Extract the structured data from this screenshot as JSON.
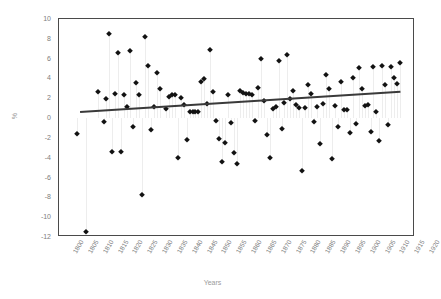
{
  "chart_data": {
    "type": "scatter",
    "title": "",
    "xlabel": "Years",
    "ylabel": "%",
    "xlim": [
      1800,
      1920
    ],
    "ylim": [
      -12,
      10
    ],
    "xtick_step": 5,
    "ytick_step": 2,
    "grid": false,
    "legend": "none",
    "marker": "diamond",
    "marker_color": "#121212",
    "dropline_color": "#ededed",
    "trendline": {
      "type": "linear",
      "color": "#3a3a3a",
      "x_start": 1807,
      "y_start": 0.7,
      "x_end": 1915,
      "y_end": 2.75
    },
    "xtick_labels": [
      "1800",
      "1805",
      "1810",
      "1815",
      "1820",
      "1825",
      "1830",
      "1835",
      "1840",
      "1845",
      "1850",
      "1855",
      "1860",
      "1865",
      "1870",
      "1875",
      "1880",
      "1885",
      "1890",
      "1895",
      "1900",
      "1905",
      "1910",
      "1915",
      "1920"
    ],
    "ytick_labels": [
      "10",
      "8",
      "6",
      "4",
      "2",
      "0",
      "-2",
      "-4",
      "-6",
      "-8",
      "-10",
      "-12"
    ],
    "points": [
      {
        "x": 1806,
        "y": -1.6
      },
      {
        "x": 1809,
        "y": -11.5
      },
      {
        "x": 1813,
        "y": 2.6
      },
      {
        "x": 1815,
        "y": -0.4
      },
      {
        "x": 1816,
        "y": 1.9
      },
      {
        "x": 1817,
        "y": 8.5
      },
      {
        "x": 1818,
        "y": -3.4
      },
      {
        "x": 1819,
        "y": 2.4
      },
      {
        "x": 1820,
        "y": 6.6
      },
      {
        "x": 1821,
        "y": -3.4
      },
      {
        "x": 1822,
        "y": 2.3
      },
      {
        "x": 1823,
        "y": 1.1
      },
      {
        "x": 1824,
        "y": 6.8
      },
      {
        "x": 1825,
        "y": -0.9
      },
      {
        "x": 1826,
        "y": 3.5
      },
      {
        "x": 1827,
        "y": 2.3
      },
      {
        "x": 1828,
        "y": -7.8
      },
      {
        "x": 1829,
        "y": 8.2
      },
      {
        "x": 1830,
        "y": 5.3
      },
      {
        "x": 1831,
        "y": -1.2
      },
      {
        "x": 1832,
        "y": 1.1
      },
      {
        "x": 1833,
        "y": 4.6
      },
      {
        "x": 1834,
        "y": 2.9
      },
      {
        "x": 1836,
        "y": 0.9
      },
      {
        "x": 1837,
        "y": 2.1
      },
      {
        "x": 1838,
        "y": 2.3
      },
      {
        "x": 1839,
        "y": 2.3
      },
      {
        "x": 1840,
        "y": -4.0
      },
      {
        "x": 1841,
        "y": 2.0
      },
      {
        "x": 1842,
        "y": 1.3
      },
      {
        "x": 1843,
        "y": -2.2
      },
      {
        "x": 1844,
        "y": 0.6
      },
      {
        "x": 1845,
        "y": 0.6
      },
      {
        "x": 1846,
        "y": 0.6
      },
      {
        "x": 1847,
        "y": 0.6
      },
      {
        "x": 1848,
        "y": 3.6
      },
      {
        "x": 1849,
        "y": 3.9
      },
      {
        "x": 1850,
        "y": 1.4
      },
      {
        "x": 1851,
        "y": 6.9
      },
      {
        "x": 1852,
        "y": 2.6
      },
      {
        "x": 1853,
        "y": -0.3
      },
      {
        "x": 1854,
        "y": -2.1
      },
      {
        "x": 1855,
        "y": -4.4
      },
      {
        "x": 1856,
        "y": -2.5
      },
      {
        "x": 1857,
        "y": 2.3
      },
      {
        "x": 1858,
        "y": -0.5
      },
      {
        "x": 1859,
        "y": -3.5
      },
      {
        "x": 1860,
        "y": -4.6
      },
      {
        "x": 1861,
        "y": 2.7
      },
      {
        "x": 1862,
        "y": 2.5
      },
      {
        "x": 1863,
        "y": 2.4
      },
      {
        "x": 1864,
        "y": 2.4
      },
      {
        "x": 1865,
        "y": 2.3
      },
      {
        "x": 1866,
        "y": -0.3
      },
      {
        "x": 1867,
        "y": 3.0
      },
      {
        "x": 1868,
        "y": 6.0
      },
      {
        "x": 1869,
        "y": 1.7
      },
      {
        "x": 1870,
        "y": -1.7
      },
      {
        "x": 1871,
        "y": -4.0
      },
      {
        "x": 1872,
        "y": 0.9
      },
      {
        "x": 1873,
        "y": 1.1
      },
      {
        "x": 1874,
        "y": 5.8
      },
      {
        "x": 1875,
        "y": -1.1
      },
      {
        "x": 1876,
        "y": 1.5
      },
      {
        "x": 1877,
        "y": 6.4
      },
      {
        "x": 1878,
        "y": 1.9
      },
      {
        "x": 1879,
        "y": 2.7
      },
      {
        "x": 1880,
        "y": 1.3
      },
      {
        "x": 1881,
        "y": 1.0
      },
      {
        "x": 1882,
        "y": -5.3
      },
      {
        "x": 1883,
        "y": 1.0
      },
      {
        "x": 1884,
        "y": 3.3
      },
      {
        "x": 1885,
        "y": 2.4
      },
      {
        "x": 1886,
        "y": -0.4
      },
      {
        "x": 1887,
        "y": 1.1
      },
      {
        "x": 1888,
        "y": -2.6
      },
      {
        "x": 1889,
        "y": 1.4
      },
      {
        "x": 1890,
        "y": 4.3
      },
      {
        "x": 1891,
        "y": 2.9
      },
      {
        "x": 1892,
        "y": -4.1
      },
      {
        "x": 1893,
        "y": 1.2
      },
      {
        "x": 1894,
        "y": -0.9
      },
      {
        "x": 1895,
        "y": 3.6
      },
      {
        "x": 1896,
        "y": 0.8
      },
      {
        "x": 1897,
        "y": 0.8
      },
      {
        "x": 1898,
        "y": -1.5
      },
      {
        "x": 1899,
        "y": 4.0
      },
      {
        "x": 1900,
        "y": -0.6
      },
      {
        "x": 1901,
        "y": 5.1
      },
      {
        "x": 1902,
        "y": 2.9
      },
      {
        "x": 1903,
        "y": 1.2
      },
      {
        "x": 1904,
        "y": 1.3
      },
      {
        "x": 1905,
        "y": -1.4
      },
      {
        "x": 1906,
        "y": 5.2
      },
      {
        "x": 1907,
        "y": 0.6
      },
      {
        "x": 1908,
        "y": -2.3
      },
      {
        "x": 1909,
        "y": 5.3
      },
      {
        "x": 1910,
        "y": 3.3
      },
      {
        "x": 1911,
        "y": -0.7
      },
      {
        "x": 1912,
        "y": 5.2
      },
      {
        "x": 1913,
        "y": 4.0
      },
      {
        "x": 1914,
        "y": 3.4
      },
      {
        "x": 1915,
        "y": 5.6
      }
    ]
  }
}
